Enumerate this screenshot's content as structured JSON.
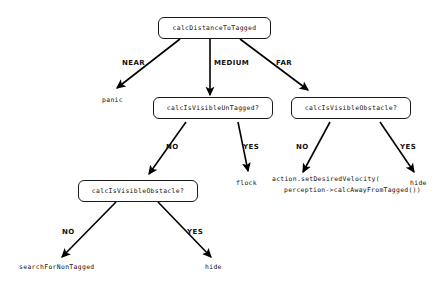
{
  "diagram": {
    "type": "decision-tree",
    "background_color": "#ffffff",
    "node_border_color": "#1a1a1a",
    "text_color": "#111111",
    "edge_color": "#000000",
    "nodes": {
      "root": "calcDistanceToTagged",
      "mid_center": "calcIsVisibleUnTagged?",
      "mid_right": "calcIsVisibleObstacle?",
      "lower_left": "calcIsVisibleObstacle?"
    },
    "leaves": {
      "panic": "panic",
      "flock": "flock",
      "action_line1": "action.setDesiredVelocity(",
      "action_line2": "perception->calcAwayFromTagged())",
      "hide_right": "hide",
      "search_for_non_tagged": "searchForNonTagged",
      "hide_bottom": "hide"
    },
    "edge_labels": {
      "near": "NEAR",
      "medium": "MEDIUM",
      "far": "FAR",
      "mid_center_no": "NO",
      "mid_center_yes": "YES",
      "mid_right_no": "NO",
      "mid_right_yes": "YES",
      "lower_left_no": "NO",
      "lower_left_yes": "YES"
    }
  }
}
